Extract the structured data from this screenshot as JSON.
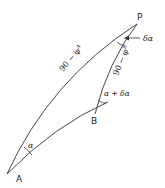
{
  "diagram": {
    "points": {
      "P": "P",
      "A": "A",
      "B": "B"
    },
    "labels": {
      "outer_side": "90 − φ",
      "outer_sub": "A",
      "inner_side": "90 − φ",
      "inner_sub": "B",
      "angle_A": "α",
      "angle_B": "α + δα",
      "angle_P": "δα"
    },
    "stroke_color": "#333333"
  }
}
